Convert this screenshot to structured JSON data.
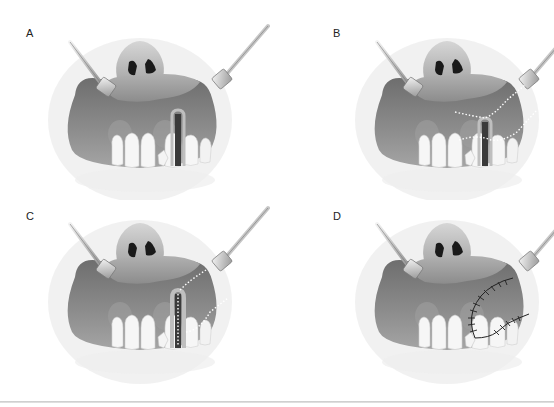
{
  "figure": {
    "panels": [
      {
        "id": "A",
        "label": "A",
        "stage": "initial-defect"
      },
      {
        "id": "B",
        "label": "B",
        "stage": "incision-lines"
      },
      {
        "id": "C",
        "label": "C",
        "stage": "flap-rotation"
      },
      {
        "id": "D",
        "label": "D",
        "stage": "sutured-closure"
      }
    ],
    "colors": {
      "gum": "#8a8a8a",
      "lip": "#9c9c9c",
      "nose": "#bdbdbd",
      "teeth": "#f6f6f6",
      "incision": "#ffffff",
      "suture": "#222222"
    }
  }
}
